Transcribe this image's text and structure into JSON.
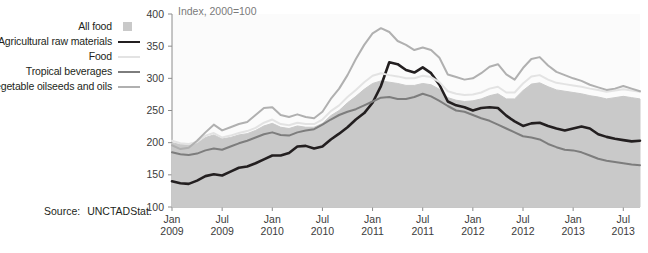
{
  "legend": {
    "items": [
      {
        "label": "All food",
        "swatch": "all-food-swatch-box",
        "color": "#c9c9c9",
        "style": "box"
      },
      {
        "label": "Agricultural raw materials",
        "swatch": "agricultural-raw-materials-swatch-line",
        "color": "#231f20",
        "style": "line"
      },
      {
        "label": "Food",
        "swatch": "food-swatch-line",
        "color": "#e3e3e3",
        "style": "line"
      },
      {
        "label": "Tropical beverages",
        "swatch": "tropical-beverages-swatch-line",
        "color": "#7d7d7d",
        "style": "line"
      },
      {
        "label": "Vegetable oilseeds and oils",
        "swatch": "vegetable-oilseeds-and-oils-swatch-line",
        "color": "#b0b0b0",
        "style": "line"
      }
    ]
  },
  "source": {
    "label": "Source:",
    "value": "UNCTADStat."
  },
  "chart_data": {
    "type": "line",
    "title": "Index, 2000=100",
    "xlabel": "",
    "ylabel": "",
    "ylim": [
      100,
      400
    ],
    "yticks": [
      100,
      150,
      200,
      250,
      300,
      350,
      400
    ],
    "grid": false,
    "legend_position": "left-outside",
    "xtick_labels": [
      {
        "line1": "Jan",
        "line2": "2009"
      },
      {
        "line1": "Jul",
        "line2": "2009"
      },
      {
        "line1": "Jan",
        "line2": "2010"
      },
      {
        "line1": "Jul",
        "line2": "2010"
      },
      {
        "line1": "Jan",
        "line2": "2011"
      },
      {
        "line1": "Jul",
        "line2": "2011"
      },
      {
        "line1": "Jan",
        "line2": "2012"
      },
      {
        "line1": "Jul",
        "line2": "2012"
      },
      {
        "line1": "Jan",
        "line2": "2013"
      },
      {
        "line1": "Jul",
        "line2": "2013"
      }
    ],
    "x": [
      "2009-01",
      "2009-02",
      "2009-03",
      "2009-04",
      "2009-05",
      "2009-06",
      "2009-07",
      "2009-08",
      "2009-09",
      "2009-10",
      "2009-11",
      "2009-12",
      "2010-01",
      "2010-02",
      "2010-03",
      "2010-04",
      "2010-05",
      "2010-06",
      "2010-07",
      "2010-08",
      "2010-09",
      "2010-10",
      "2010-11",
      "2010-12",
      "2011-01",
      "2011-02",
      "2011-03",
      "2011-04",
      "2011-05",
      "2011-06",
      "2011-07",
      "2011-08",
      "2011-09",
      "2011-10",
      "2011-11",
      "2011-12",
      "2012-01",
      "2012-02",
      "2012-03",
      "2012-04",
      "2012-05",
      "2012-06",
      "2012-07",
      "2012-08",
      "2012-09",
      "2012-10",
      "2012-11",
      "2012-12",
      "2013-01",
      "2013-02",
      "2013-03",
      "2013-04",
      "2013-05",
      "2013-06",
      "2013-07",
      "2013-08",
      "2013-09"
    ],
    "series": [
      {
        "name": "All food",
        "render": "area",
        "color": "#c9c9c9",
        "values": [
          200,
          197,
          196,
          199,
          208,
          212,
          206,
          208,
          212,
          214,
          219,
          226,
          230,
          224,
          222,
          226,
          224,
          224,
          230,
          242,
          250,
          262,
          272,
          283,
          292,
          296,
          294,
          292,
          289,
          289,
          292,
          290,
          283,
          270,
          266,
          264,
          265,
          268,
          273,
          276,
          268,
          268,
          281,
          291,
          293,
          287,
          282,
          280,
          278,
          276,
          273,
          271,
          268,
          270,
          272,
          270,
          268
        ]
      },
      {
        "name": "Agricultural raw materials",
        "render": "line",
        "color": "#231f20",
        "values": [
          140,
          137,
          136,
          141,
          148,
          151,
          149,
          155,
          161,
          163,
          168,
          174,
          180,
          180,
          184,
          194,
          195,
          191,
          194,
          205,
          214,
          224,
          236,
          246,
          262,
          288,
          325,
          322,
          313,
          309,
          317,
          308,
          290,
          264,
          258,
          255,
          250,
          254,
          255,
          254,
          242,
          233,
          226,
          230,
          231,
          226,
          222,
          219,
          222,
          225,
          222,
          213,
          209,
          206,
          204,
          202,
          203
        ]
      },
      {
        "name": "Food",
        "render": "line",
        "color": "#e3e3e3",
        "values": [
          203,
          199,
          198,
          201,
          211,
          215,
          208,
          211,
          215,
          218,
          223,
          231,
          236,
          229,
          227,
          231,
          229,
          229,
          236,
          249,
          258,
          271,
          282,
          294,
          304,
          308,
          305,
          303,
          300,
          300,
          304,
          302,
          294,
          280,
          276,
          274,
          275,
          278,
          284,
          287,
          278,
          278,
          292,
          303,
          305,
          298,
          293,
          291,
          289,
          287,
          284,
          282,
          279,
          281,
          283,
          281,
          279
        ]
      },
      {
        "name": "Tropical beverages",
        "render": "line",
        "color": "#7d7d7d",
        "values": [
          185,
          182,
          181,
          183,
          188,
          191,
          189,
          194,
          199,
          203,
          208,
          213,
          216,
          212,
          211,
          216,
          219,
          221,
          228,
          236,
          243,
          248,
          252,
          258,
          264,
          270,
          271,
          268,
          268,
          271,
          276,
          272,
          265,
          257,
          250,
          248,
          243,
          238,
          234,
          228,
          222,
          216,
          210,
          208,
          205,
          198,
          193,
          189,
          188,
          185,
          180,
          175,
          172,
          170,
          168,
          166,
          165
        ]
      },
      {
        "name": "Vegetable oilseeds and oils",
        "render": "line",
        "color": "#b0b0b0",
        "values": [
          196,
          190,
          192,
          203,
          216,
          228,
          219,
          224,
          229,
          232,
          243,
          254,
          255,
          243,
          240,
          244,
          240,
          238,
          248,
          268,
          284,
          305,
          330,
          352,
          370,
          378,
          372,
          358,
          352,
          344,
          348,
          344,
          332,
          306,
          302,
          298,
          300,
          308,
          318,
          322,
          306,
          298,
          316,
          330,
          333,
          320,
          310,
          305,
          300,
          296,
          290,
          286,
          282,
          284,
          288,
          284,
          280
        ]
      }
    ]
  }
}
